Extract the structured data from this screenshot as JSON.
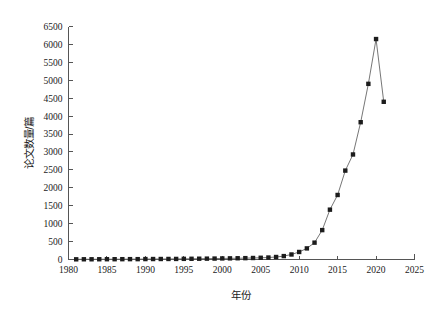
{
  "chart_data": {
    "type": "line",
    "title": "",
    "subtitle": "",
    "xlabel": "年份",
    "ylabel": "论文数量/篇",
    "xlim": [
      1980,
      2025
    ],
    "ylim": [
      0,
      6500
    ],
    "xtick_step": 5,
    "ytick_step": 500,
    "grid": false,
    "legend": null,
    "legend_position": "none",
    "marker": "square",
    "marker_color": "#1c1c1c",
    "line_color": "#666666",
    "xticks": [
      1980,
      1985,
      1990,
      1995,
      2000,
      2005,
      2010,
      2015,
      2020,
      2025
    ],
    "yticks": [
      0,
      500,
      1000,
      1500,
      2000,
      2500,
      3000,
      3500,
      4000,
      4500,
      5000,
      5500,
      6000,
      6500
    ],
    "x": [
      1981,
      1982,
      1983,
      1984,
      1985,
      1986,
      1987,
      1988,
      1989,
      1990,
      1991,
      1992,
      1993,
      1994,
      1995,
      1996,
      1997,
      1998,
      1999,
      2000,
      2001,
      2002,
      2003,
      2004,
      2005,
      2006,
      2007,
      2008,
      2009,
      2010,
      2011,
      2012,
      2013,
      2014,
      2015,
      2016,
      2017,
      2018,
      2019,
      2020,
      2021
    ],
    "values": [
      5,
      6,
      6,
      7,
      8,
      8,
      9,
      10,
      10,
      12,
      13,
      14,
      15,
      16,
      18,
      20,
      22,
      24,
      26,
      30,
      32,
      35,
      38,
      42,
      48,
      55,
      70,
      95,
      140,
      210,
      310,
      470,
      820,
      1390,
      1800,
      2480,
      2930,
      3830,
      4900,
      6150,
      4400
    ],
    "series": [
      {
        "name": "论文数量",
        "values": [
          5,
          6,
          6,
          7,
          8,
          8,
          9,
          10,
          10,
          12,
          13,
          14,
          15,
          16,
          18,
          20,
          22,
          24,
          26,
          30,
          32,
          35,
          38,
          42,
          48,
          55,
          70,
          95,
          140,
          210,
          310,
          470,
          820,
          1390,
          1800,
          2480,
          2930,
          3830,
          4900,
          6150,
          4400
        ]
      }
    ],
    "annotations": []
  },
  "axes": {
    "x_title": "年份",
    "y_title": "论文数量/篇",
    "x_tick_labels": [
      "1980",
      "1985",
      "1990",
      "1995",
      "2000",
      "2005",
      "2010",
      "2015",
      "2020",
      "2025"
    ],
    "y_tick_labels": [
      "0",
      "500",
      "1000",
      "1500",
      "2000",
      "2500",
      "3000",
      "3500",
      "4000",
      "4500",
      "5000",
      "5500",
      "6000",
      "6500"
    ]
  },
  "colors": {
    "axis": "#555555",
    "line": "#666666",
    "marker": "#1c1c1c",
    "text": "#1a1a1a",
    "background": "#ffffff"
  }
}
